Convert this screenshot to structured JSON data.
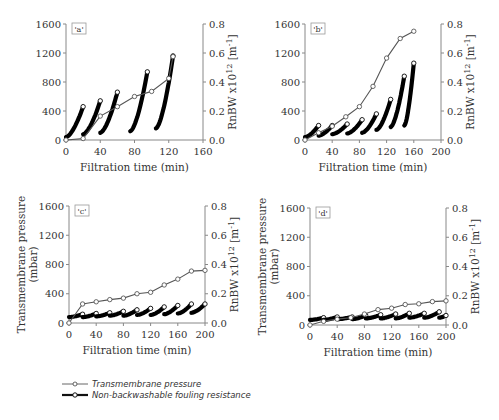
{
  "chart_data": [
    {
      "type": "line",
      "panel_label": "'a'",
      "xlabel": "Filtration time (min)",
      "ylabel_left": "",
      "ylabel_right": "RnBW x10^12 [m^-1]",
      "xlim": [
        0,
        160
      ],
      "xticks": [
        0,
        40,
        80,
        120,
        160
      ],
      "ylim_left": [
        0,
        1600
      ],
      "yticks_left": [
        0,
        400,
        800,
        1200,
        1600
      ],
      "ylim_right": [
        0,
        0.8
      ],
      "yticks_right": [
        "0.0",
        "0.2",
        "0.4",
        "0.6",
        "0.8"
      ],
      "series": [
        {
          "name": "Transmembrane pressure",
          "axis": "left",
          "x": [
            0,
            20,
            40,
            60,
            80,
            100,
            120,
            125
          ],
          "y": [
            0,
            20,
            330,
            460,
            600,
            670,
            850,
            1150
          ]
        },
        {
          "name": "Non-backwashable fouling resistance",
          "axis": "right",
          "cycles": [
            {
              "x0": 0,
              "x1": 20,
              "y0": 0.02,
              "y1": 0.23
            },
            {
              "x0": 20,
              "x1": 40,
              "y0": 0.04,
              "y1": 0.27
            },
            {
              "x0": 40,
              "x1": 60,
              "y0": 0.05,
              "y1": 0.33
            },
            {
              "x0": 75,
              "x1": 95,
              "y0": 0.06,
              "y1": 0.47
            },
            {
              "x0": 105,
              "x1": 125,
              "y0": 0.08,
              "y1": 0.58
            }
          ]
        }
      ]
    },
    {
      "type": "line",
      "panel_label": "'b'",
      "xlabel": "Filtration time (min)",
      "ylabel_left": "",
      "ylabel_right": "RnBW x10^12 [m^-1]",
      "xlim": [
        0,
        200
      ],
      "xticks": [
        0,
        40,
        80,
        120,
        160,
        200
      ],
      "ylim_left": [
        0,
        1600
      ],
      "yticks_left": [
        0,
        400,
        800,
        1200,
        1600
      ],
      "ylim_right": [
        0,
        0.8
      ],
      "yticks_right": [
        "0.0",
        "0.2",
        "0.4",
        "0.6",
        "0.8"
      ],
      "series": [
        {
          "name": "Transmembrane pressure",
          "axis": "left",
          "x": [
            0,
            20,
            40,
            60,
            80,
            100,
            120,
            140,
            160
          ],
          "y": [
            0,
            100,
            190,
            320,
            460,
            740,
            1130,
            1400,
            1500
          ]
        },
        {
          "name": "Non-backwashable fouling resistance",
          "axis": "right",
          "cycles": [
            {
              "x0": 0,
              "x1": 20,
              "y0": 0.02,
              "y1": 0.1
            },
            {
              "x0": 20,
              "x1": 40,
              "y0": 0.03,
              "y1": 0.1
            },
            {
              "x0": 40,
              "x1": 62,
              "y0": 0.04,
              "y1": 0.11
            },
            {
              "x0": 62,
              "x1": 84,
              "y0": 0.045,
              "y1": 0.14
            },
            {
              "x0": 84,
              "x1": 105,
              "y0": 0.05,
              "y1": 0.18
            },
            {
              "x0": 105,
              "x1": 126,
              "y0": 0.07,
              "y1": 0.28
            },
            {
              "x0": 126,
              "x1": 146,
              "y0": 0.09,
              "y1": 0.44
            },
            {
              "x0": 146,
              "x1": 160,
              "y0": 0.1,
              "y1": 0.53
            }
          ]
        }
      ]
    },
    {
      "type": "line",
      "panel_label": "'c'",
      "xlabel": "Filtration time (min)",
      "ylabel_left": "Transmembrane pressure (mbar)",
      "ylabel_right": "RnBW x10^12 [m^-1]",
      "xlim": [
        0,
        200
      ],
      "xticks": [
        0,
        40,
        80,
        120,
        160,
        200
      ],
      "ylim_left": [
        0,
        1600
      ],
      "yticks_left": [
        0,
        400,
        800,
        1200,
        1600
      ],
      "ylim_right": [
        0,
        0.8
      ],
      "yticks_right": [
        "0.0",
        "0.2",
        "0.4",
        "0.6",
        "0.8"
      ],
      "series": [
        {
          "name": "Transmembrane pressure",
          "axis": "left",
          "x": [
            0,
            20,
            40,
            60,
            80,
            100,
            120,
            140,
            160,
            180,
            200
          ],
          "y": [
            0,
            260,
            290,
            320,
            340,
            400,
            420,
            520,
            600,
            710,
            720
          ]
        },
        {
          "name": "Non-backwashable fouling resistance",
          "axis": "right",
          "cycles": [
            {
              "x0": 0,
              "x1": 20,
              "y0": 0.04,
              "y1": 0.06
            },
            {
              "x0": 20,
              "x1": 40,
              "y0": 0.04,
              "y1": 0.065
            },
            {
              "x0": 40,
              "x1": 60,
              "y0": 0.045,
              "y1": 0.07
            },
            {
              "x0": 60,
              "x1": 80,
              "y0": 0.05,
              "y1": 0.08
            },
            {
              "x0": 80,
              "x1": 100,
              "y0": 0.05,
              "y1": 0.09
            },
            {
              "x0": 100,
              "x1": 120,
              "y0": 0.055,
              "y1": 0.1
            },
            {
              "x0": 120,
              "x1": 140,
              "y0": 0.055,
              "y1": 0.11
            },
            {
              "x0": 140,
              "x1": 160,
              "y0": 0.06,
              "y1": 0.12
            },
            {
              "x0": 160,
              "x1": 180,
              "y0": 0.065,
              "y1": 0.13
            },
            {
              "x0": 180,
              "x1": 200,
              "y0": 0.07,
              "y1": 0.13
            }
          ]
        }
      ]
    },
    {
      "type": "line",
      "panel_label": "'d'",
      "xlabel": "Filtration time (min)",
      "ylabel_left": "Transmembrane pressure (mbar)",
      "ylabel_right": "RnBW x10^12 [m^-1]",
      "xlim": [
        0,
        200
      ],
      "xticks": [
        0,
        40,
        80,
        120,
        160,
        200
      ],
      "ylim_left": [
        0,
        1600
      ],
      "yticks_left": [
        0,
        400,
        800,
        1200,
        1600
      ],
      "ylim_right": [
        0,
        0.8
      ],
      "yticks_right": [
        "0.0",
        "0.2",
        "0.4",
        "0.6",
        "0.8"
      ],
      "series": [
        {
          "name": "Transmembrane pressure",
          "axis": "left",
          "x": [
            0,
            20,
            40,
            60,
            80,
            100,
            120,
            140,
            160,
            180,
            200
          ],
          "y": [
            0,
            50,
            80,
            100,
            150,
            210,
            230,
            280,
            290,
            320,
            330
          ]
        },
        {
          "name": "Non-backwashable fouling resistance",
          "axis": "right",
          "cycles": [
            {
              "x0": 0,
              "x1": 20,
              "y0": 0.035,
              "y1": 0.05
            },
            {
              "x0": 20,
              "x1": 40,
              "y0": 0.035,
              "y1": 0.055
            },
            {
              "x0": 40,
              "x1": 62,
              "y0": 0.04,
              "y1": 0.055
            },
            {
              "x0": 62,
              "x1": 82,
              "y0": 0.04,
              "y1": 0.065
            },
            {
              "x0": 82,
              "x1": 104,
              "y0": 0.045,
              "y1": 0.07
            },
            {
              "x0": 104,
              "x1": 126,
              "y0": 0.045,
              "y1": 0.075
            },
            {
              "x0": 126,
              "x1": 146,
              "y0": 0.045,
              "y1": 0.08
            },
            {
              "x0": 146,
              "x1": 168,
              "y0": 0.05,
              "y1": 0.08
            },
            {
              "x0": 168,
              "x1": 190,
              "y0": 0.05,
              "y1": 0.09
            },
            {
              "x0": 190,
              "x1": 200,
              "y0": 0.05,
              "y1": 0.065
            }
          ]
        }
      ]
    }
  ],
  "legend": {
    "items": [
      {
        "label": "Transmembrane pressure",
        "style": "thin-line-open-circle"
      },
      {
        "label": "Non-backwashable fouling resistance",
        "style": "thick-line-open-circle"
      }
    ]
  },
  "layout": {
    "panels": [
      {
        "left": 66,
        "right": 203,
        "top": 24,
        "bottom": 140
      },
      {
        "left": 305,
        "right": 441,
        "top": 24,
        "bottom": 140
      },
      {
        "left": 69,
        "right": 205,
        "top": 206,
        "bottom": 323
      },
      {
        "left": 310,
        "right": 446,
        "top": 208,
        "bottom": 325
      }
    ]
  },
  "colors": {
    "axis": "#888888",
    "tmp_line": "#555555",
    "fouling": "#000000",
    "text": "#333333"
  }
}
